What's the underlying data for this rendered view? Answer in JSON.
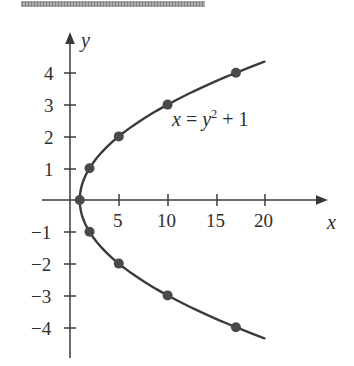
{
  "figure": {
    "title_rule": "",
    "background_color": "#ffffff",
    "ink_color": "#3a3a3a",
    "text_color": "#2e2e2e",
    "point_color": "#4a4a4a"
  },
  "axes": {
    "x_axis_label": "x",
    "y_axis_label": "y",
    "x_ticks": [
      {
        "value": 5,
        "label": "5"
      },
      {
        "value": 10,
        "label": "10"
      },
      {
        "value": 15,
        "label": "15"
      },
      {
        "value": 20,
        "label": "20"
      }
    ],
    "y_ticks": [
      {
        "value": 4,
        "label": "4"
      },
      {
        "value": 3,
        "label": "3"
      },
      {
        "value": 2,
        "label": "2"
      },
      {
        "value": 1,
        "label": "1"
      },
      {
        "value": -1,
        "label": "−1"
      },
      {
        "value": -2,
        "label": "−2"
      },
      {
        "value": -3,
        "label": "−3"
      },
      {
        "value": -4,
        "label": "−4"
      }
    ]
  },
  "annotation": {
    "equation_plain": "x = y2 + 1",
    "equation_lhs": "x",
    "equation_eq": " = ",
    "equation_var": "y",
    "equation_exp": "2",
    "equation_tail": " + 1"
  },
  "chart_data": {
    "type": "line",
    "title": "",
    "subtitle": "",
    "xlabel": "x",
    "ylabel": "y",
    "xlim": [
      -1.5,
      22.5
    ],
    "ylim": [
      -5.2,
      5.2
    ],
    "grid": false,
    "legend": null,
    "annotations": [
      {
        "text": "x = y^2 + 1",
        "x": 11.5,
        "y": 2.45
      }
    ],
    "series": [
      {
        "name": "x = y^2 + 1",
        "equation": "x = y^2 + 1",
        "orientation": "opens-right",
        "vertex": {
          "x": 1,
          "y": 0
        },
        "markers": [
          {
            "x": 1,
            "y": 0
          },
          {
            "x": 2,
            "y": 1
          },
          {
            "x": 5,
            "y": 2
          },
          {
            "x": 10,
            "y": 3
          },
          {
            "x": 17,
            "y": 4
          },
          {
            "x": 2,
            "y": -1
          },
          {
            "x": 5,
            "y": -2
          },
          {
            "x": 10,
            "y": -3
          },
          {
            "x": 17,
            "y": -4
          }
        ],
        "y_range": [
          -4.35,
          4.35
        ]
      }
    ]
  }
}
